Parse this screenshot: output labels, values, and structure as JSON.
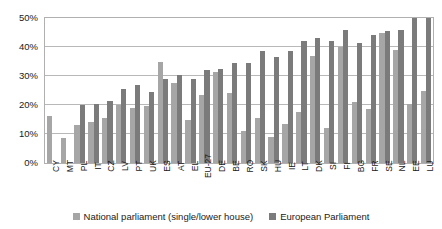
{
  "chart_data": {
    "type": "bar",
    "title": "",
    "subtitle": "",
    "xlabel": "",
    "ylabel": "",
    "ylim": [
      0,
      50
    ],
    "ytick_values": [
      0,
      10,
      20,
      30,
      40,
      50
    ],
    "ytick_labels": [
      "0%",
      "10%",
      "20%",
      "30%",
      "40%",
      "50%"
    ],
    "grid": true,
    "legend_position": "bottom-center",
    "categories": [
      "CY",
      "MT",
      "PL",
      "IT",
      "CZ",
      "LV",
      "PT",
      "UK",
      "ES",
      "AT",
      "EL",
      "EU-27",
      "DE",
      "BE",
      "RO",
      "SK",
      "HU",
      "IE",
      "LT",
      "DK",
      "SI",
      "FI",
      "BG",
      "FR",
      "SE",
      "NL",
      "EE",
      "LU"
    ],
    "series": [
      {
        "name": "National parliament (single/lower house)",
        "color": "#a6a6a6",
        "values": [
          16.1,
          8.7,
          13.0,
          14.3,
          15.5,
          20.0,
          19.0,
          19.5,
          35.0,
          27.5,
          14.7,
          23.5,
          31.5,
          24.0,
          11.0,
          15.5,
          9.0,
          13.3,
          17.5,
          37.0,
          12.0,
          40.0,
          21.0,
          18.5,
          45.0,
          39.0,
          20.5,
          25.0
        ]
      },
      {
        "name": "European Parliament",
        "color": "#7b7b7b",
        "values": [
          0.0,
          0.0,
          20.0,
          20.5,
          21.5,
          25.5,
          27.0,
          24.5,
          29.0,
          30.5,
          29.0,
          32.0,
          32.5,
          34.5,
          34.5,
          38.5,
          36.5,
          38.5,
          42.0,
          43.0,
          42.0,
          46.0,
          41.5,
          44.0,
          45.5,
          46.0,
          50.0,
          50.0
        ]
      }
    ]
  },
  "legend": {
    "items": [
      {
        "label": "National parliament (single/lower house)",
        "key": "national"
      },
      {
        "label": "European Parliament",
        "key": "european"
      }
    ]
  }
}
